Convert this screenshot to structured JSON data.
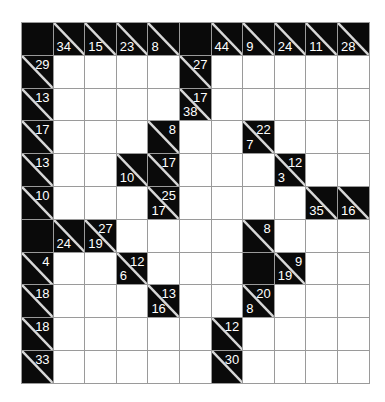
{
  "puzzle": {
    "type": "kakuro",
    "rows": 11,
    "cols": 11,
    "colors": {
      "black": "#0a0a0a",
      "white": "#ffffff",
      "grid_line": "#9a9a9a",
      "clue_text": "#ffffff"
    },
    "legend": "B = black block, W = empty white cell, clue cells have down (below-left) and across (above-right) sums",
    "grid": [
      [
        {
          "t": "B"
        },
        {
          "t": "C",
          "down": "34",
          "across": ""
        },
        {
          "t": "C",
          "down": "15",
          "across": ""
        },
        {
          "t": "C",
          "down": "23",
          "across": ""
        },
        {
          "t": "C",
          "down": "8",
          "across": ""
        },
        {
          "t": "B"
        },
        {
          "t": "C",
          "down": "44",
          "across": ""
        },
        {
          "t": "C",
          "down": "9",
          "across": ""
        },
        {
          "t": "C",
          "down": "24",
          "across": ""
        },
        {
          "t": "C",
          "down": "11",
          "across": ""
        },
        {
          "t": "C",
          "down": "28",
          "across": ""
        }
      ],
      [
        {
          "t": "C",
          "down": "",
          "across": "29"
        },
        {
          "t": "W"
        },
        {
          "t": "W"
        },
        {
          "t": "W"
        },
        {
          "t": "W"
        },
        {
          "t": "C",
          "down": "",
          "across": "27"
        },
        {
          "t": "W"
        },
        {
          "t": "W"
        },
        {
          "t": "W"
        },
        {
          "t": "W"
        },
        {
          "t": "W"
        }
      ],
      [
        {
          "t": "C",
          "down": "",
          "across": "13"
        },
        {
          "t": "W"
        },
        {
          "t": "W"
        },
        {
          "t": "W"
        },
        {
          "t": "W"
        },
        {
          "t": "C",
          "down": "38",
          "across": "17"
        },
        {
          "t": "W"
        },
        {
          "t": "W"
        },
        {
          "t": "W"
        },
        {
          "t": "W"
        },
        {
          "t": "W"
        }
      ],
      [
        {
          "t": "C",
          "down": "",
          "across": "17"
        },
        {
          "t": "W"
        },
        {
          "t": "W"
        },
        {
          "t": "W"
        },
        {
          "t": "C",
          "down": "",
          "across": "8"
        },
        {
          "t": "W"
        },
        {
          "t": "W"
        },
        {
          "t": "C",
          "down": "7",
          "across": "22"
        },
        {
          "t": "W"
        },
        {
          "t": "W"
        },
        {
          "t": "W"
        }
      ],
      [
        {
          "t": "C",
          "down": "",
          "across": "13"
        },
        {
          "t": "W"
        },
        {
          "t": "W"
        },
        {
          "t": "C",
          "down": "10",
          "across": ""
        },
        {
          "t": "C",
          "down": "",
          "across": "17"
        },
        {
          "t": "W"
        },
        {
          "t": "W"
        },
        {
          "t": "W"
        },
        {
          "t": "C",
          "down": "3",
          "across": "12"
        },
        {
          "t": "W"
        },
        {
          "t": "W"
        }
      ],
      [
        {
          "t": "C",
          "down": "",
          "across": "10"
        },
        {
          "t": "W"
        },
        {
          "t": "W"
        },
        {
          "t": "W"
        },
        {
          "t": "C",
          "down": "17",
          "across": "25"
        },
        {
          "t": "W"
        },
        {
          "t": "W"
        },
        {
          "t": "W"
        },
        {
          "t": "W"
        },
        {
          "t": "C",
          "down": "35",
          "across": ""
        },
        {
          "t": "C",
          "down": "16",
          "across": ""
        }
      ],
      [
        {
          "t": "B"
        },
        {
          "t": "C",
          "down": "24",
          "across": ""
        },
        {
          "t": "C",
          "down": "19",
          "across": "27"
        },
        {
          "t": "W"
        },
        {
          "t": "W"
        },
        {
          "t": "W"
        },
        {
          "t": "W"
        },
        {
          "t": "C",
          "down": "",
          "across": "8"
        },
        {
          "t": "W"
        },
        {
          "t": "W"
        },
        {
          "t": "W"
        }
      ],
      [
        {
          "t": "C",
          "down": "",
          "across": "4"
        },
        {
          "t": "W"
        },
        {
          "t": "W"
        },
        {
          "t": "C",
          "down": "6",
          "across": "12"
        },
        {
          "t": "W"
        },
        {
          "t": "W"
        },
        {
          "t": "W"
        },
        {
          "t": "B"
        },
        {
          "t": "C",
          "down": "19",
          "across": "9"
        },
        {
          "t": "W"
        },
        {
          "t": "W"
        }
      ],
      [
        {
          "t": "C",
          "down": "",
          "across": "18"
        },
        {
          "t": "W"
        },
        {
          "t": "W"
        },
        {
          "t": "W"
        },
        {
          "t": "C",
          "down": "16",
          "across": "13"
        },
        {
          "t": "W"
        },
        {
          "t": "W"
        },
        {
          "t": "C",
          "down": "8",
          "across": "20"
        },
        {
          "t": "W"
        },
        {
          "t": "W"
        },
        {
          "t": "W"
        }
      ],
      [
        {
          "t": "C",
          "down": "",
          "across": "18"
        },
        {
          "t": "W"
        },
        {
          "t": "W"
        },
        {
          "t": "W"
        },
        {
          "t": "W"
        },
        {
          "t": "W"
        },
        {
          "t": "C",
          "down": "",
          "across": "12"
        },
        {
          "t": "W"
        },
        {
          "t": "W"
        },
        {
          "t": "W"
        },
        {
          "t": "W"
        }
      ],
      [
        {
          "t": "C",
          "down": "",
          "across": "33"
        },
        {
          "t": "W"
        },
        {
          "t": "W"
        },
        {
          "t": "W"
        },
        {
          "t": "W"
        },
        {
          "t": "W"
        },
        {
          "t": "C",
          "down": "",
          "across": "30"
        },
        {
          "t": "W"
        },
        {
          "t": "W"
        },
        {
          "t": "W"
        },
        {
          "t": "W"
        }
      ]
    ]
  }
}
